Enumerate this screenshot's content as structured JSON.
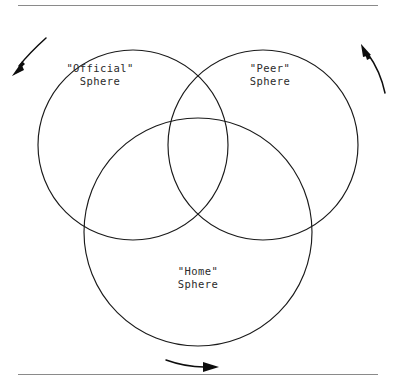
{
  "figure": {
    "background_color": "#ffffff",
    "stroke_color": "#1a1a1a",
    "rule_color": "#8a8a8a",
    "text_color": "#2b2b2b"
  },
  "rules": [
    {
      "name": "top-rule",
      "y": 5,
      "x1": 18,
      "x2": 378
    },
    {
      "name": "bottom-rule",
      "y": 374,
      "x1": 18,
      "x2": 378
    }
  ],
  "circles": [
    {
      "id": "official",
      "cx": 133,
      "cy": 145,
      "r": 95
    },
    {
      "id": "peer",
      "cx": 263,
      "cy": 145,
      "r": 95
    },
    {
      "id": "home",
      "cx": 198,
      "cy": 232,
      "r": 114
    }
  ],
  "labels": {
    "official": {
      "line1": "\"Official\"",
      "line2": "Sphere"
    },
    "peer": {
      "line1": "\"Peer\"",
      "line2": "Sphere"
    },
    "home": {
      "line1": "\"Home\"",
      "line2": "Sphere"
    }
  },
  "arrows": [
    {
      "id": "top-left-arrow",
      "direction": "down-left",
      "icon": "curved-arrow-icon"
    },
    {
      "id": "top-right-arrow",
      "direction": "up",
      "icon": "curved-arrow-icon"
    },
    {
      "id": "bottom-arrow",
      "direction": "right",
      "icon": "curved-arrow-icon"
    }
  ]
}
